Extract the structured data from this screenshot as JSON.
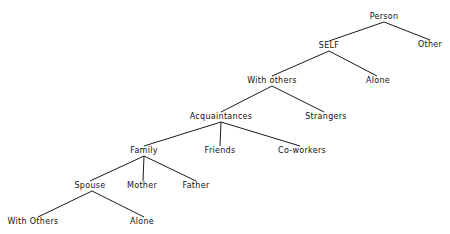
{
  "diagram": {
    "type": "tree",
    "nodes": {
      "person": {
        "label": "Person",
        "x": 384,
        "y": 17
      },
      "other": {
        "label": "Other",
        "x": 430,
        "y": 45
      },
      "self": {
        "label": "SELF",
        "x": 329,
        "y": 46
      },
      "alone_self": {
        "label": "Alone",
        "x": 378,
        "y": 81
      },
      "with_others": {
        "label": "With others",
        "x": 272,
        "y": 81
      },
      "strangers": {
        "label": "Strangers",
        "x": 326,
        "y": 117
      },
      "acquaintances": {
        "label": "Acquaintances",
        "x": 221,
        "y": 117
      },
      "friends": {
        "label": "Friends",
        "x": 220,
        "y": 151
      },
      "co_workers": {
        "label": "Co-workers",
        "x": 302,
        "y": 151
      },
      "family": {
        "label": "Family",
        "x": 144,
        "y": 151
      },
      "spouse": {
        "label": "Spouse",
        "x": 90,
        "y": 186
      },
      "mother": {
        "label": "Mother",
        "x": 142,
        "y": 186
      },
      "father": {
        "label": "Father",
        "x": 196,
        "y": 186
      },
      "spouse_with_others": {
        "label": "With Others",
        "x": 33,
        "y": 222
      },
      "spouse_alone": {
        "label": "Alone",
        "x": 142,
        "y": 222
      }
    },
    "edges": [
      {
        "from": "person",
        "to": "self",
        "x1": 384,
        "y1": 22,
        "x2": 329,
        "y2": 41
      },
      {
        "from": "person",
        "to": "other",
        "x1": 384,
        "y1": 22,
        "x2": 430,
        "y2": 40
      },
      {
        "from": "self",
        "to": "with_others",
        "x1": 329,
        "y1": 51,
        "x2": 272,
        "y2": 76
      },
      {
        "from": "self",
        "to": "alone_self",
        "x1": 329,
        "y1": 51,
        "x2": 377,
        "y2": 76
      },
      {
        "from": "with_others",
        "to": "acquaintances",
        "x1": 272,
        "y1": 86,
        "x2": 221,
        "y2": 112
      },
      {
        "from": "with_others",
        "to": "strangers",
        "x1": 272,
        "y1": 86,
        "x2": 324,
        "y2": 112
      },
      {
        "from": "acquaintances",
        "to": "family",
        "x1": 221,
        "y1": 122,
        "x2": 144,
        "y2": 146
      },
      {
        "from": "acquaintances",
        "to": "friends",
        "x1": 221,
        "y1": 122,
        "x2": 220,
        "y2": 146
      },
      {
        "from": "acquaintances",
        "to": "co_workers",
        "x1": 221,
        "y1": 122,
        "x2": 300,
        "y2": 146
      },
      {
        "from": "family",
        "to": "spouse",
        "x1": 144,
        "y1": 156,
        "x2": 90,
        "y2": 181
      },
      {
        "from": "family",
        "to": "mother",
        "x1": 144,
        "y1": 156,
        "x2": 143,
        "y2": 181
      },
      {
        "from": "family",
        "to": "father",
        "x1": 144,
        "y1": 156,
        "x2": 196,
        "y2": 181
      },
      {
        "from": "spouse",
        "to": "spouse_with_others",
        "x1": 92,
        "y1": 191,
        "x2": 38,
        "y2": 217
      },
      {
        "from": "spouse",
        "to": "spouse_alone",
        "x1": 92,
        "y1": 191,
        "x2": 144,
        "y2": 217
      }
    ],
    "colors": {
      "line": "#1a1a1a",
      "text": "#111111",
      "background": "#ffffff"
    }
  }
}
